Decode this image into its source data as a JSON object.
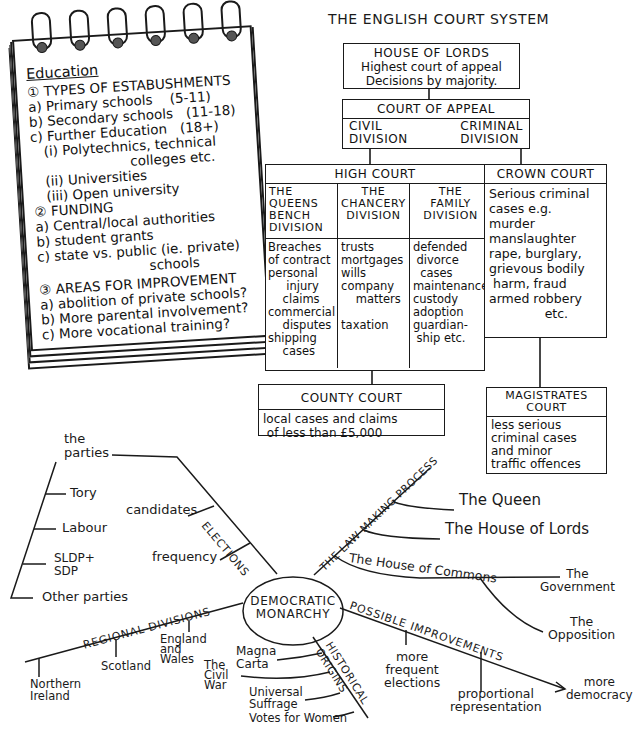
{
  "notebook": {
    "title": "Education",
    "sections": [
      {
        "heading": "① TYPES OF ESTABUSHMENTS",
        "items": [
          "a) Primary schools    (5-11)",
          "b) Secondary schools   (11-18)",
          "c) Further Education   (18+)",
          "   (i) Polytechnics, technical",
          "                       colleges etc.",
          "   (ii) Universities",
          "   (iii) Open university"
        ]
      },
      {
        "heading": "② FUNDING",
        "items": [
          "a) Central/local authorities",
          "b) student grants",
          "c) state vs. public (ie. private)",
          "                          schools"
        ]
      },
      {
        "heading": "③ AREAS FOR IMPROVEMENT",
        "items": [
          "a) abolition of private schools?",
          "b) More parental involvement?",
          "c) More vocational training?"
        ]
      }
    ]
  },
  "court_system": {
    "title": "THE ENGLISH COURT SYSTEM",
    "house_of_lords": {
      "name": "HOUSE OF LORDS",
      "lines": [
        "Highest court of appeal",
        "Decisions by majority."
      ]
    },
    "court_of_appeal": {
      "name": "COURT OF APPEAL",
      "divisions": [
        "CIVIL\nDIVISION",
        "CRIMINAL\nDIVISION"
      ]
    },
    "high_court": {
      "name": "HIGH COURT",
      "divisions": [
        {
          "name": "THE\nQUEENS\nBENCH\nDIVISION",
          "cases": "Breaches\nof contract\npersonal\n     injury\n    claims\ncommercial\n    disputes\nshipping\n    cases"
        },
        {
          "name": "THE\nCHANCERY\nDIVISION",
          "cases": "trusts\nmortgages\nwills\ncompany\n    matters\n\ntaxation"
        },
        {
          "name": "THE\nFAMILY\nDIVISION",
          "cases": "defended\n divorce\n  cases\nmaintenance\ncustody\nadoption\nguardian-\n ship etc."
        }
      ]
    },
    "crown_court": {
      "name": "CROWN COURT",
      "body": "Serious criminal\ncases e.g.\nmurder\nmanslaughter\nrape, burglary,\ngrievous bodily\n harm, fraud\narmed robbery\n              etc."
    },
    "county_court": {
      "name": "COUNTY COURT",
      "body": "local cases and claims\n of less than £5,000"
    },
    "magistrates_court": {
      "name": "MAGISTRATES\nCOURT",
      "body": "less serious\ncriminal cases\nand minor\ntraffic offences"
    }
  },
  "mind_map": {
    "center": "DEMOCRATIC\nMONARCHY",
    "elections": {
      "label": "ELECTIONS",
      "parties": "the\nparties",
      "party_list": [
        "Tory",
        "Labour",
        "SLDP+\nSDP",
        "Other parties"
      ],
      "candidates": "candidates",
      "frequency": "frequency"
    },
    "law_making": {
      "label": "THE LAW MAKING PROCESS",
      "queen": "The Queen",
      "lords": "The House of Lords",
      "commons": "The House of Commons",
      "government": "The\nGovernment",
      "opposition": "The\nOpposition"
    },
    "regional": {
      "label": "REGIONAL DIVISIONS",
      "items": [
        "Northern\nIreland",
        "Scotland",
        "England\nand\nWales"
      ]
    },
    "historical": {
      "label": "HISTORICAL\nORIGINS",
      "items": [
        "Magna\nCarta",
        "The\nCivil\nWar",
        "Universal\nSuffrage",
        "Votes for Women"
      ]
    },
    "improvements": {
      "label": "POSSIBLE IMPROVEMENTS",
      "items": [
        "more\nfrequent\nelections",
        "proportional\nrepresentation"
      ],
      "result": "more\ndemocracy"
    }
  }
}
